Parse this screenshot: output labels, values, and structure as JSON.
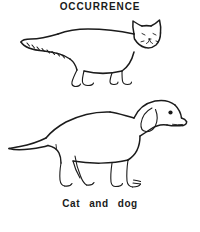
{
  "page": {
    "background_color": "#ffffff",
    "ink_color": "#1b1b1b",
    "width": 200,
    "height": 232
  },
  "heading": {
    "text": "OCCURRENCE"
  },
  "caption": {
    "text": "Cat   and   dog"
  },
  "figures": [
    {
      "name": "cat",
      "label": "Cat",
      "style": "black-and-white line-art outline drawing",
      "description": "Side-profile cat facing right with pointed triangular ears, long bushy tail with hatch marks curving to the left, and four legs",
      "facing": "right"
    },
    {
      "name": "dog",
      "label": "dog",
      "style": "black-and-white line-art outline drawing",
      "description": "Side-profile dog facing right with a floppy pendant ear, long muzzle, tail extending left, and four legs",
      "facing": "right"
    }
  ]
}
